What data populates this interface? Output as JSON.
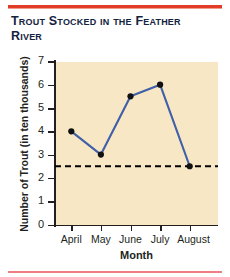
{
  "title": "Trout Stocked in the Feather River",
  "colors": {
    "rule_top": "#e23b26",
    "rule_bottom": "#ef7f83",
    "plot_background": "#f7e7c4",
    "line": "#3f5fa8",
    "marker": "#111111",
    "reference_line": "#000000",
    "text": "#231f20",
    "title_text": "#13233f"
  },
  "chart_data": {
    "type": "line",
    "title": "Trout Stocked in the Feather River",
    "xlabel": "Month",
    "ylabel": "Number of Trout (in ten thousands)",
    "categories": [
      "April",
      "May",
      "June",
      "July",
      "August"
    ],
    "values": [
      4,
      3,
      5.5,
      6,
      2.5
    ],
    "series": [
      {
        "name": "Trout stocked",
        "values": [
          4,
          3,
          5.5,
          6,
          2.5
        ]
      }
    ],
    "ylim": [
      0,
      7
    ],
    "yticks": [
      0,
      1,
      2,
      3,
      4,
      5,
      6,
      7
    ],
    "ytick_labels": [
      "0",
      "1",
      "2",
      "3",
      "4",
      "5",
      "6",
      "7"
    ],
    "xtick_labels": [
      "April",
      "May",
      "June",
      "July",
      "August"
    ],
    "grid": false,
    "legend": false,
    "annotations": [
      {
        "type": "reference_line",
        "orientation": "horizontal",
        "value": 2.5,
        "style": "dashed",
        "label": ""
      }
    ]
  }
}
